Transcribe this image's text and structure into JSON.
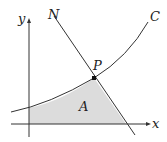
{
  "diagram": {
    "labels": {
      "y_axis": "y",
      "x_axis": "x",
      "normal_line": "N",
      "curve": "C",
      "point": "P",
      "region": "A"
    },
    "colors": {
      "region_fill": "#dcdcdc",
      "stroke": "#333333",
      "background": "#ffffff"
    }
  }
}
